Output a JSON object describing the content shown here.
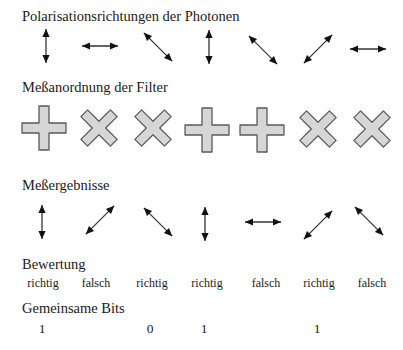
{
  "sections": {
    "photons": {
      "title": "Polarisationsrichtungen der Photonen",
      "arrows": [
        {
          "orientation": "vertical",
          "x": 46,
          "y": 46
        },
        {
          "orientation": "horizontal",
          "x": 100,
          "y": 46
        },
        {
          "orientation": "diagonal-down",
          "x": 158,
          "y": 47
        },
        {
          "orientation": "vertical",
          "x": 209,
          "y": 47
        },
        {
          "orientation": "diagonal-down",
          "x": 263,
          "y": 50
        },
        {
          "orientation": "diagonal-up",
          "x": 318,
          "y": 49
        },
        {
          "orientation": "horizontal",
          "x": 368,
          "y": 49
        }
      ]
    },
    "filters": {
      "title": "Meßanordnung der Filter",
      "items": [
        {
          "type": "plus",
          "x": 44,
          "y": 128
        },
        {
          "type": "cross",
          "x": 99,
          "y": 128
        },
        {
          "type": "cross",
          "x": 153,
          "y": 128
        },
        {
          "type": "plus",
          "x": 207,
          "y": 130
        },
        {
          "type": "plus",
          "x": 262,
          "y": 130
        },
        {
          "type": "cross",
          "x": 318,
          "y": 129
        },
        {
          "type": "cross",
          "x": 372,
          "y": 129
        }
      ],
      "fill_color": "#d6d6d6",
      "stroke_color": "#5a5a5a"
    },
    "results": {
      "title": "Meßergebnisse",
      "arrows": [
        {
          "orientation": "vertical",
          "x": 42,
          "y": 222
        },
        {
          "orientation": "diagonal-up",
          "x": 100,
          "y": 220
        },
        {
          "orientation": "diagonal-down",
          "x": 158,
          "y": 222
        },
        {
          "orientation": "vertical",
          "x": 205,
          "y": 224
        },
        {
          "orientation": "horizontal",
          "x": 263,
          "y": 222
        },
        {
          "orientation": "diagonal-up",
          "x": 318,
          "y": 225
        },
        {
          "orientation": "diagonal-down",
          "x": 369,
          "y": 221
        }
      ]
    },
    "evaluation": {
      "title": "Bewertung",
      "values": [
        {
          "label": "richtig",
          "x": 43
        },
        {
          "label": "falsch",
          "x": 96
        },
        {
          "label": "richtig",
          "x": 152
        },
        {
          "label": "richtig",
          "x": 207
        },
        {
          "label": "falsch",
          "x": 266
        },
        {
          "label": "richtig",
          "x": 319
        },
        {
          "label": "falsch",
          "x": 372
        }
      ]
    },
    "shared_bits": {
      "title": "Gemeinsame Bits",
      "values": [
        {
          "label": "1",
          "x": 42
        },
        {
          "label": "0",
          "x": 150
        },
        {
          "label": "1",
          "x": 204
        },
        {
          "label": "1",
          "x": 317
        }
      ]
    }
  }
}
